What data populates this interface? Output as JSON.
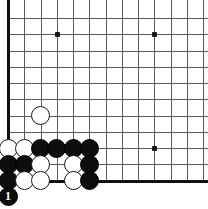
{
  "board": {
    "title": "Go board diagram",
    "region": "bottom-left corner",
    "grid": {
      "origin_x": 8,
      "origin_y": 18,
      "spacing": 16.25,
      "cols": 13,
      "rows": 11,
      "line_color": "#5a5a5a",
      "edge_color": "#111111",
      "background_color": "#ffffff"
    },
    "edges": {
      "left": true,
      "bottom": true,
      "top": false,
      "right": false
    },
    "star_points": [
      {
        "col": 3,
        "row": 1
      },
      {
        "col": 9,
        "row": 1
      },
      {
        "col": 9,
        "row": 8
      }
    ],
    "stones": [
      {
        "col": 2,
        "row": 6,
        "color": "white",
        "label": ""
      },
      {
        "col": 0,
        "row": 8,
        "color": "white",
        "label": ""
      },
      {
        "col": 1,
        "row": 8,
        "color": "white",
        "label": ""
      },
      {
        "col": 2,
        "row": 8,
        "color": "black",
        "label": ""
      },
      {
        "col": 3,
        "row": 8,
        "color": "black",
        "label": ""
      },
      {
        "col": 4,
        "row": 8,
        "color": "black",
        "label": ""
      },
      {
        "col": 5,
        "row": 8,
        "color": "black",
        "label": ""
      },
      {
        "col": 0,
        "row": 9,
        "color": "black",
        "label": ""
      },
      {
        "col": 1,
        "row": 9,
        "color": "black",
        "label": ""
      },
      {
        "col": 2,
        "row": 9,
        "color": "white",
        "label": ""
      },
      {
        "col": 4,
        "row": 9,
        "color": "white",
        "label": ""
      },
      {
        "col": 5,
        "row": 9,
        "color": "black",
        "label": ""
      },
      {
        "col": 0,
        "row": 10,
        "color": "black",
        "label": ""
      },
      {
        "col": 1,
        "row": 10,
        "color": "white",
        "label": ""
      },
      {
        "col": 2,
        "row": 10,
        "color": "white",
        "label": ""
      },
      {
        "col": 4,
        "row": 10,
        "color": "white",
        "label": ""
      },
      {
        "col": 5,
        "row": 10,
        "color": "black",
        "label": ""
      },
      {
        "col": 0,
        "row": 11,
        "color": "black",
        "label": "1"
      }
    ],
    "move_number": "1",
    "move_color": "black"
  }
}
